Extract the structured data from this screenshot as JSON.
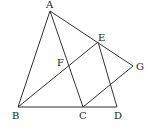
{
  "diagram": {
    "points": {
      "A": {
        "x": 50,
        "y": 11,
        "label": "A",
        "lx": 46,
        "ly": 8
      },
      "B": {
        "x": 18,
        "y": 107,
        "label": "B",
        "lx": 12,
        "ly": 119
      },
      "C": {
        "x": 83,
        "y": 107,
        "label": "C",
        "lx": 79,
        "ly": 119
      },
      "D": {
        "x": 117,
        "y": 107,
        "label": "D",
        "lx": 114,
        "ly": 119
      },
      "E": {
        "x": 98,
        "y": 42,
        "label": "E",
        "lx": 98,
        "ly": 41
      },
      "F": {
        "x": 68,
        "y": 65,
        "label": "F",
        "lx": 57,
        "ly": 66
      },
      "G": {
        "x": 133,
        "y": 66,
        "label": "G",
        "lx": 136,
        "ly": 70
      }
    },
    "segments": [
      [
        "A",
        "B"
      ],
      [
        "A",
        "C"
      ],
      [
        "A",
        "G"
      ],
      [
        "B",
        "D"
      ],
      [
        "B",
        "E"
      ],
      [
        "E",
        "D"
      ],
      [
        "C",
        "G"
      ]
    ]
  }
}
